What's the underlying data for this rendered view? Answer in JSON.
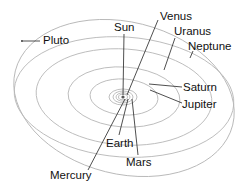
{
  "diagram": {
    "colors": {
      "orbit": "#b8b8b8",
      "leader": "#222222",
      "text": "#111111",
      "background": "#ffffff"
    },
    "labels": {
      "pluto": "Pluto",
      "sun": "Sun",
      "venus": "Venus",
      "uranus": "Uranus",
      "neptune": "Neptune",
      "saturn": "Saturn",
      "jupiter": "Jupiter",
      "earth": "Earth",
      "mars": "Mars",
      "mercury": "Mercury"
    }
  }
}
